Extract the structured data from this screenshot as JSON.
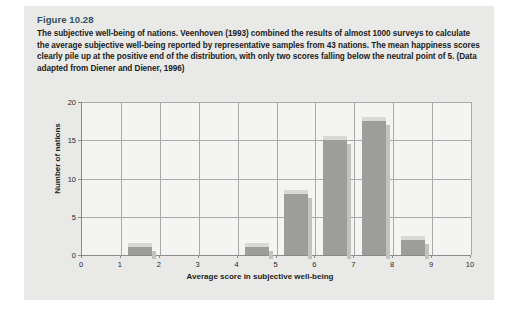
{
  "figure": {
    "number": "Figure 10.28",
    "caption": "The subjective well-being of nations. Veenhoven (1993) combined the results of almost 1000 surveys to calculate the average subjective well-being reported by representative samples from 43 nations. The mean happiness scores clearly pile up at the positive end of the distribution, with only two scores falling below the neutral point of 5. (Data adapted from Diener and Diener, 1996)",
    "number_color": "#33505c"
  },
  "chart_data": {
    "type": "bar",
    "title": "",
    "xlabel": "Average score in subjective well-being",
    "ylabel": "Number of nations",
    "xlim": [
      0,
      10
    ],
    "ylim": [
      0,
      20
    ],
    "xticks": [
      "0",
      "1",
      "2",
      "3",
      "4",
      "5",
      "6",
      "7",
      "8",
      "9",
      "10"
    ],
    "yticks": [
      "0",
      "5",
      "10",
      "15",
      "20"
    ],
    "grid": true,
    "legend": "none",
    "bin_edges": [
      0,
      1,
      2,
      3,
      4,
      5,
      6,
      7,
      8,
      9,
      10
    ],
    "categories": [
      "0-1",
      "1-2",
      "2-3",
      "3-4",
      "4-5",
      "5-6",
      "6-7",
      "7-8",
      "8-9",
      "9-10"
    ],
    "values": [
      0,
      1,
      0,
      0,
      1,
      8,
      15,
      17.5,
      2,
      0
    ],
    "bar_color": "#9d9d9b",
    "bar_side_color": "#c2c2bf",
    "bar_top_color": "#d8d8d5",
    "plot_background": "#f4f4f2",
    "gridline_color": "#a9a9a9"
  }
}
